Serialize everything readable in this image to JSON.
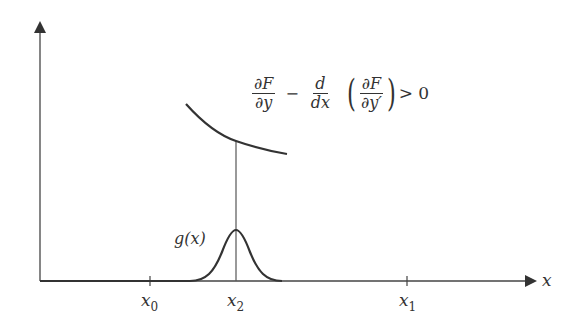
{
  "diagram": {
    "title_formula": {
      "term1": {
        "num": "∂F",
        "den": "∂y"
      },
      "minus": "−",
      "term2": {
        "num": "d",
        "den": "dx"
      },
      "term3": {
        "num": "∂F",
        "den": "∂y′"
      },
      "open_paren": "(",
      "close_paren": ")",
      "relation": "> 0"
    },
    "x_axis_label": "x",
    "function_label": "g(x)",
    "ticks": [
      {
        "base": "x",
        "sub": "0"
      },
      {
        "base": "x",
        "sub": "2"
      },
      {
        "base": "x",
        "sub": "1"
      }
    ],
    "colors": {
      "stroke": "#333333",
      "background": "#ffffff"
    }
  }
}
